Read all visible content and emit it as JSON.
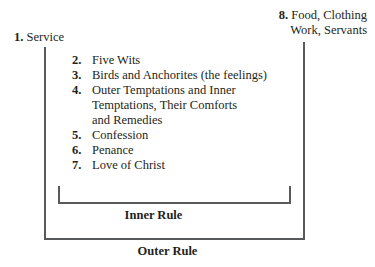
{
  "diagram": {
    "line_color": "#58595b",
    "text_color": "#231f20",
    "background": "#ffffff"
  },
  "nodes": {
    "service": {
      "number": "1.",
      "label": "Service"
    },
    "provisions": {
      "number": "8.",
      "line1": "Food, Clothing",
      "line2": "Work, Servants"
    }
  },
  "inner_items": [
    {
      "number": "2.",
      "lines": [
        "Five Wits"
      ]
    },
    {
      "number": "3.",
      "lines": [
        "Birds and Anchorites (the feelings)"
      ]
    },
    {
      "number": "4.",
      "lines": [
        "Outer Temptations and Inner",
        "Temptations, Their Comforts",
        "and Remedies"
      ]
    },
    {
      "number": "5.",
      "lines": [
        "Confession"
      ]
    },
    {
      "number": "6.",
      "lines": [
        "Penance"
      ]
    },
    {
      "number": "7.",
      "lines": [
        "Love of Christ"
      ]
    }
  ],
  "captions": {
    "inner_rule": "Inner Rule",
    "outer_rule": "Outer Rule"
  }
}
